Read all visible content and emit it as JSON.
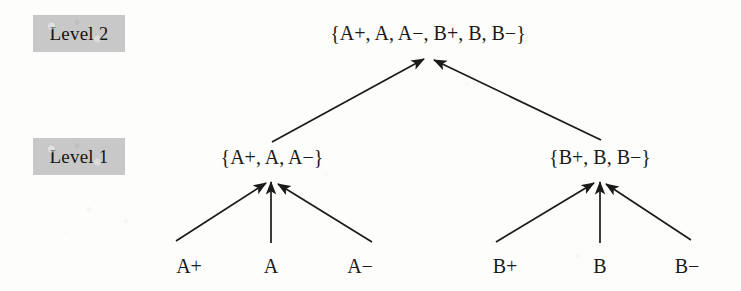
{
  "figure": {
    "background_color": "#fdfdfc",
    "ink_color": "#1a1a1a",
    "highlight_color": "#c8c8c8"
  },
  "level_labels": [
    {
      "id": "level-2",
      "text": "Level 2",
      "x": 33,
      "y": 15,
      "width": 92,
      "height": 37
    },
    {
      "id": "level-1",
      "text": "Level 1",
      "x": 33,
      "y": 138,
      "width": 92,
      "height": 37
    }
  ],
  "nodes": {
    "level2": [
      {
        "id": "root",
        "label": "{A+, A, A−, B+, B, B−}",
        "x": 428,
        "y": 20
      }
    ],
    "level1": [
      {
        "id": "group-a",
        "label": "{A+, A, A−}",
        "x": 272,
        "y": 144
      },
      {
        "id": "group-b",
        "label": "{B+, B, B−}",
        "x": 600,
        "y": 144
      }
    ],
    "level0": [
      {
        "id": "leaf-a-plus",
        "label": "A+",
        "x": 189,
        "y": 253
      },
      {
        "id": "leaf-a",
        "label": "A",
        "x": 271,
        "y": 253
      },
      {
        "id": "leaf-a-minus",
        "label": "A−",
        "x": 360,
        "y": 253
      },
      {
        "id": "leaf-b-plus",
        "label": "B+",
        "x": 505,
        "y": 253
      },
      {
        "id": "leaf-b",
        "label": "B",
        "x": 600,
        "y": 253
      },
      {
        "id": "leaf-b-minus",
        "label": "B−",
        "x": 687,
        "y": 253
      }
    ]
  },
  "edges": [
    {
      "id": "edge-a-plus-to-group-a",
      "from": "leaf-a-plus",
      "to": "group-a",
      "x1": 176,
      "y1": 241,
      "x2": 266,
      "y2": 183
    },
    {
      "id": "edge-a-to-group-a",
      "from": "leaf-a",
      "to": "group-a",
      "x1": 271,
      "y1": 243,
      "x2": 271,
      "y2": 182
    },
    {
      "id": "edge-a-minus-to-group-a",
      "from": "leaf-a-minus",
      "to": "group-a",
      "x1": 372,
      "y1": 242,
      "x2": 278,
      "y2": 184
    },
    {
      "id": "edge-b-plus-to-group-b",
      "from": "leaf-b-plus",
      "to": "group-b",
      "x1": 496,
      "y1": 242,
      "x2": 594,
      "y2": 183
    },
    {
      "id": "edge-b-to-group-b",
      "from": "leaf-b",
      "to": "group-b",
      "x1": 600,
      "y1": 243,
      "x2": 600,
      "y2": 182
    },
    {
      "id": "edge-b-minus-to-group-b",
      "from": "leaf-b-minus",
      "to": "group-b",
      "x1": 691,
      "y1": 240,
      "x2": 606,
      "y2": 184
    },
    {
      "id": "edge-group-a-to-root",
      "from": "group-a",
      "to": "root",
      "x1": 272,
      "y1": 142,
      "x2": 424,
      "y2": 59
    },
    {
      "id": "edge-group-b-to-root",
      "from": "group-b",
      "to": "root",
      "x1": 601,
      "y1": 140,
      "x2": 434,
      "y2": 60
    }
  ]
}
